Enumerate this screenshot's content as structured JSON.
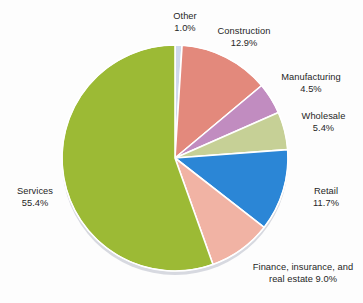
{
  "chart_data": {
    "type": "pie",
    "title": "",
    "subtitle": "",
    "xlabel": "",
    "ylabel": "",
    "legend_position": "none",
    "grid": false,
    "labels_outside": true,
    "start_angle_deg": 0,
    "direction": "clockwise",
    "categories": [
      "Other",
      "Construction",
      "Manufacturing",
      "Wholesale",
      "Retail",
      "Finance, insurance, and real estate",
      "Services"
    ],
    "values": [
      1.0,
      12.9,
      4.5,
      5.4,
      11.7,
      9.0,
      55.4
    ],
    "value_suffix": "%",
    "colors": [
      "#cfd9ec",
      "#e3897c",
      "#c18cc0",
      "#c6d096",
      "#2b86d6",
      "#f1b3a4",
      "#9cba35"
    ],
    "slices": [
      {
        "name": "Other",
        "value": 1.0,
        "value_text": "1.0%",
        "color": "#cfd9ec",
        "label_lines": [
          "Other",
          "1.0%"
        ],
        "label_align": "center"
      },
      {
        "name": "Construction",
        "value": 12.9,
        "value_text": "12.9%",
        "color": "#e3897c",
        "label_lines": [
          "Construction",
          "12.9%"
        ],
        "label_align": "center"
      },
      {
        "name": "Manufacturing",
        "value": 4.5,
        "value_text": "4.5%",
        "color": "#c18cc0",
        "label_lines": [
          "Manufacturing",
          "4.5%"
        ],
        "label_align": "center"
      },
      {
        "name": "Wholesale",
        "value": 5.4,
        "value_text": "5.4%",
        "color": "#c6d096",
        "label_lines": [
          "Wholesale",
          "5.4%"
        ],
        "label_align": "center"
      },
      {
        "name": "Retail",
        "value": 11.7,
        "value_text": "11.7%",
        "color": "#2b86d6",
        "label_lines": [
          "Retail",
          "11.7%"
        ],
        "label_align": "center"
      },
      {
        "name": "Finance, insurance, and real estate",
        "value": 9.0,
        "value_text": "9.0%",
        "color": "#f1b3a4",
        "label_lines": [
          "Finance, insurance, and",
          "real estate 9.0%"
        ],
        "label_align": "center"
      },
      {
        "name": "Services",
        "value": 55.4,
        "value_text": "55.4%",
        "color": "#9cba35",
        "label_lines": [
          "Services",
          "55.4%"
        ],
        "label_align": "center"
      }
    ]
  },
  "labels": {
    "other": {
      "name": "Other",
      "value": "1.0%"
    },
    "construction": {
      "name": "Construction",
      "value": "12.9%"
    },
    "manufacturing": {
      "name": "Manufacturing",
      "value": "4.5%"
    },
    "wholesale": {
      "name": "Wholesale",
      "value": "5.4%"
    },
    "retail": {
      "name": "Retail",
      "value": "11.7%"
    },
    "finance": {
      "line1": "Finance, insurance, and",
      "line2": "real estate 9.0%"
    },
    "services": {
      "name": "Services",
      "value": "55.4%"
    }
  },
  "style": {
    "background": "#fdfdfd",
    "text_color": "#262626",
    "separator_color": "#ffffff",
    "rim_shadow_color": "#c9c9d2",
    "pie_center_x": 175,
    "pie_center_y": 158,
    "pie_radius": 113
  }
}
